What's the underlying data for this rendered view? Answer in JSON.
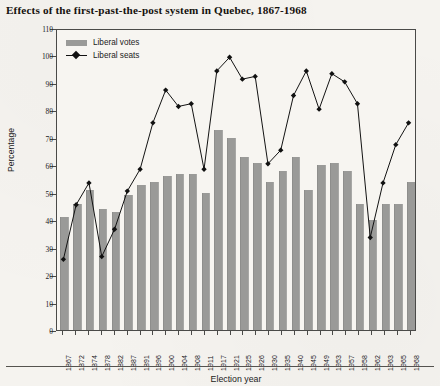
{
  "title": "Effects of the first-past-the-post system in Quebec, 1867-1968",
  "legend": {
    "votes_label": "Liberal votes",
    "seats_label": "Liberal seats"
  },
  "colors": {
    "bar": "#9a9a98",
    "line": "#111111",
    "axis": "#4a4a48",
    "page_background": "#f5f3ef",
    "plot_background": "#f7f5f1"
  },
  "chart_data": {
    "type": "bar",
    "title": "Effects of the first-past-the-post system in Quebec, 1867-1968",
    "xlabel": "Election year",
    "ylabel": "Percentage",
    "ylim": [
      0,
      110
    ],
    "yticks": [
      0,
      10,
      20,
      30,
      40,
      50,
      60,
      70,
      80,
      90,
      100,
      110
    ],
    "grid": false,
    "legend_position": "top-left-inside",
    "categories": [
      "1867",
      "1872",
      "1874",
      "1878",
      "1882",
      "1887",
      "1891",
      "1896",
      "1900",
      "1904",
      "1908",
      "1911",
      "1917",
      "1921",
      "1925",
      "1926",
      "1930",
      "1935",
      "1940",
      "1945",
      "1949",
      "1953",
      "1957",
      "1958",
      "1962",
      "1963",
      "1965",
      "1968"
    ],
    "series": [
      {
        "name": "Liberal votes",
        "type": "bar",
        "values": [
          41,
          46,
          51,
          44,
          43,
          49,
          53,
          54,
          56,
          57,
          57,
          50,
          73,
          70,
          63,
          61,
          54,
          58,
          63,
          51,
          60,
          61,
          58,
          46,
          40,
          46,
          46,
          54
        ]
      },
      {
        "name": "Liberal seats",
        "type": "line",
        "marker": "diamond",
        "values": [
          26,
          46,
          54,
          27,
          37,
          51,
          59,
          76,
          88,
          82,
          83,
          59,
          95,
          100,
          92,
          93,
          61,
          66,
          86,
          95,
          81,
          94,
          91,
          83,
          34,
          54,
          68,
          76
        ]
      }
    ]
  }
}
